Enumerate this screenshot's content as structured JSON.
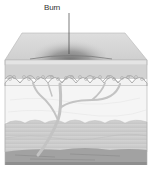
{
  "diagram": {
    "labels": [
      {
        "text": "Burn",
        "target": "burn-area"
      }
    ],
    "layers": [
      {
        "name": "surface"
      },
      {
        "name": "epidermis"
      },
      {
        "name": "dermis"
      },
      {
        "name": "subcutaneous-fat"
      },
      {
        "name": "muscle"
      }
    ],
    "colors": {
      "surface_top": "#d6d6d6",
      "surface_front": "#e6e6e6",
      "burn": "#6e6e6e",
      "epidermis": "#cfcfcf",
      "papillae": "#b8b8b8",
      "dermis": "#f4f4f4",
      "vessel": "#c2c2c2",
      "fat": "#cdcdcd",
      "muscle": "#9a9a9a",
      "outline": "#a8a8a8",
      "label_line": "#444444"
    }
  }
}
